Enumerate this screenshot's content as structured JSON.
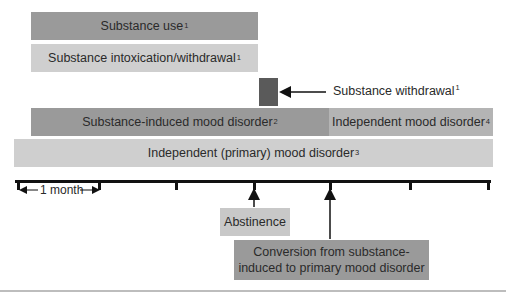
{
  "bars": {
    "substance_use": {
      "label": "Substance use",
      "sup": "1"
    },
    "intoxication_withdrawal": {
      "label": "Substance intoxication/withdrawal",
      "sup": "1"
    },
    "substance_induced": {
      "label": "Substance-induced mood disorder",
      "sup": "2"
    },
    "independent_mood": {
      "label": "Independent mood disorder",
      "sup": "4"
    },
    "independent_primary": {
      "label": "Independent (primary) mood disorder",
      "sup": "3"
    }
  },
  "withdrawal_marker": {
    "label": "Substance withdrawal",
    "sup": "1"
  },
  "timeline": {
    "scale_label": "1 month",
    "tick_positions_px": [
      18,
      99,
      176,
      254,
      330,
      410,
      488
    ]
  },
  "annotations": {
    "abstinence": "Abstinence",
    "conversion_line1": "Conversion from substance-",
    "conversion_line2": "induced to primary mood disorder"
  },
  "colors": {
    "dark_bar": "#9a9a9a",
    "light_bar": "#cfcfcf",
    "withdrawal_square": "#5a5a5a",
    "axis": "#111111"
  }
}
